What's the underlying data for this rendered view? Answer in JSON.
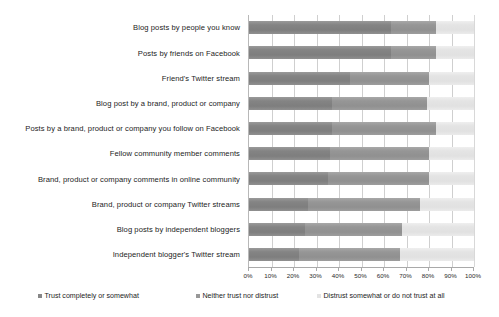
{
  "chart_data": {
    "type": "bar",
    "subtype": "stacked-horizontal-100-percent",
    "title": "",
    "subtitle": "",
    "xlabel": "",
    "ylabel": "",
    "xlim": [
      0,
      100
    ],
    "xticks": [
      "0%",
      "10%",
      "20%",
      "30%",
      "40%",
      "50%",
      "60%",
      "70%",
      "80%",
      "90%",
      "100%"
    ],
    "xtick_values": [
      0,
      10,
      20,
      30,
      40,
      50,
      60,
      70,
      80,
      90,
      100
    ],
    "grid": true,
    "grid_axis": "x",
    "legend_position": "bottom",
    "orientation": "horizontal",
    "categories": [
      "Blog posts by people you know",
      "Posts by friends on Facebook",
      "Friend's Twitter stream",
      "Blog post by a brand, product or company",
      "Posts by a brand, product or company you follow on Facebook",
      "Fellow community member comments",
      "Brand, product or company comments in online community",
      "Brand, product or company Twitter streams",
      "Blog posts by independent bloggers",
      "Independent blogger's Twitter stream"
    ],
    "series": [
      {
        "name": "Trust completely or somewhat",
        "color": "#878787",
        "values": [
          63,
          63,
          45,
          37,
          37,
          36,
          35,
          26,
          25,
          22
        ]
      },
      {
        "name": "Neither trust nor distrust",
        "color": "#989898",
        "values": [
          20,
          20,
          35,
          42,
          46,
          44,
          45,
          50,
          43,
          45
        ]
      },
      {
        "name": "Distrust somewhat or do not trust at all",
        "color": "#e3e3e3",
        "values": [
          17,
          17,
          20,
          21,
          17,
          20,
          20,
          24,
          32,
          33
        ]
      }
    ]
  },
  "legend": {
    "items": [
      "Trust completely or somewhat",
      "Neither trust nor distrust",
      "Distrust somewhat or do not trust at all"
    ]
  }
}
